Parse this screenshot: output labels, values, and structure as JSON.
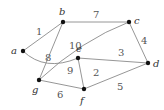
{
  "graph": {
    "type": "weighted-undirected-graph",
    "nodes": [
      {
        "id": "a",
        "label": "a",
        "x": 23,
        "y": 51
      },
      {
        "id": "b",
        "label": "b",
        "x": 63,
        "y": 22
      },
      {
        "id": "c",
        "label": "c",
        "x": 129,
        "y": 22
      },
      {
        "id": "d",
        "label": "d",
        "x": 148,
        "y": 63
      },
      {
        "id": "e",
        "label": "e",
        "x": 78,
        "y": 58
      },
      {
        "id": "f",
        "label": "f",
        "x": 84,
        "y": 89
      },
      {
        "id": "g",
        "label": "g",
        "x": 39,
        "y": 80
      }
    ],
    "edges": [
      {
        "from": "a",
        "to": "b",
        "weight": "1"
      },
      {
        "from": "b",
        "to": "c",
        "weight": "7"
      },
      {
        "from": "c",
        "to": "d",
        "weight": "4"
      },
      {
        "from": "b",
        "to": "g",
        "weight": "8"
      },
      {
        "from": "g",
        "to": "c",
        "weight": "10"
      },
      {
        "from": "a",
        "to": "e",
        "weight": "9"
      },
      {
        "from": "e",
        "to": "d",
        "weight": "3"
      },
      {
        "from": "e",
        "to": "f",
        "weight": "2"
      },
      {
        "from": "f",
        "to": "d",
        "weight": "5"
      },
      {
        "from": "g",
        "to": "f",
        "weight": "6"
      }
    ]
  }
}
